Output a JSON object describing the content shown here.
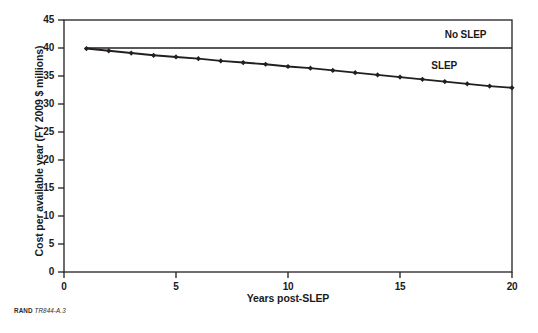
{
  "figure": {
    "source_note_org": "RAND",
    "source_note_id": "TR844-A.3"
  },
  "chart_data": {
    "type": "line",
    "title": "",
    "xlabel": "Years post-SLEP",
    "ylabel": "Cost per available year (FY 2009 $ millions)",
    "xlim": [
      0,
      20
    ],
    "ylim": [
      0,
      45
    ],
    "xticks": [
      "0",
      "5",
      "10",
      "15",
      "20"
    ],
    "xtick_values": [
      0,
      5,
      10,
      15,
      20
    ],
    "yticks": [
      "0",
      "5",
      "10",
      "15",
      "20",
      "25",
      "30",
      "35",
      "40",
      "45"
    ],
    "ytick_values": [
      0,
      5,
      10,
      15,
      20,
      25,
      30,
      35,
      40,
      45
    ],
    "grid": false,
    "legend": "inline-annotations",
    "series": [
      {
        "name": "No SLEP",
        "marker": "none",
        "label_x": 17.0,
        "label_y": 42.2,
        "x": [
          1,
          20
        ],
        "values": [
          40.0,
          40.0
        ]
      },
      {
        "name": "SLEP",
        "marker": "diamond",
        "label_x": 16.4,
        "label_y": 36.6,
        "x": [
          1,
          2,
          3,
          4,
          5,
          6,
          7,
          8,
          9,
          10,
          11,
          12,
          13,
          14,
          15,
          16,
          17,
          18,
          19,
          20
        ],
        "values": [
          39.9,
          39.5,
          39.1,
          38.7,
          38.4,
          38.1,
          37.7,
          37.4,
          37.1,
          36.7,
          36.4,
          36.0,
          35.6,
          35.2,
          34.8,
          34.4,
          34.0,
          33.6,
          33.2,
          32.9
        ]
      }
    ]
  }
}
